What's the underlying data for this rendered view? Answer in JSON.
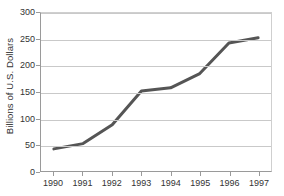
{
  "chart_data": {
    "type": "line",
    "title": "",
    "xlabel": "",
    "ylabel": "Billions of U.S. Dollars",
    "categories": [
      "1990",
      "1991",
      "1992",
      "1993",
      "1994",
      "1995",
      "1996",
      "1997"
    ],
    "values": [
      42,
      52,
      88,
      152,
      158,
      185,
      243,
      253
    ],
    "series": [
      {
        "name": "Billions of U.S. Dollars",
        "values": [
          42,
          52,
          88,
          152,
          158,
          185,
          243,
          253
        ]
      }
    ],
    "ylim": [
      0,
      300
    ],
    "y_ticks": [
      0,
      50,
      100,
      150,
      200,
      250,
      300
    ],
    "y_tick_labels": [
      "0",
      "50",
      "100",
      "150",
      "200",
      "250",
      "300"
    ],
    "x_tick_labels": [
      "1990",
      "1991",
      "1992",
      "1993",
      "1994",
      "1995",
      "1996",
      "1997"
    ],
    "grid": true,
    "legend": "none",
    "line_color": "#555555",
    "grid_color": "#c9c9c9",
    "axis_color": "#9a9a9a",
    "background_color": "#ffffff"
  }
}
